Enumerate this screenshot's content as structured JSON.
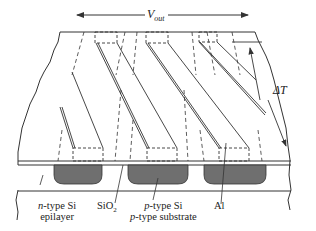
{
  "diagram": {
    "labels": {
      "vout": {
        "symbol": "V",
        "subscript": "out"
      },
      "delta_t": "ΔT",
      "n_type": {
        "prefix": "n",
        "text": "-type Si",
        "line2": "epilayer"
      },
      "sio2": {
        "text": "SiO",
        "subscript": "2"
      },
      "p_type": {
        "prefix": "p",
        "text": "-type Si",
        "line2_prefix": "p",
        "line2": "-type substrate"
      },
      "al": "Al"
    },
    "colors": {
      "line": "#333333",
      "p_region": "#6f6f6f",
      "background": "#ffffff"
    }
  }
}
